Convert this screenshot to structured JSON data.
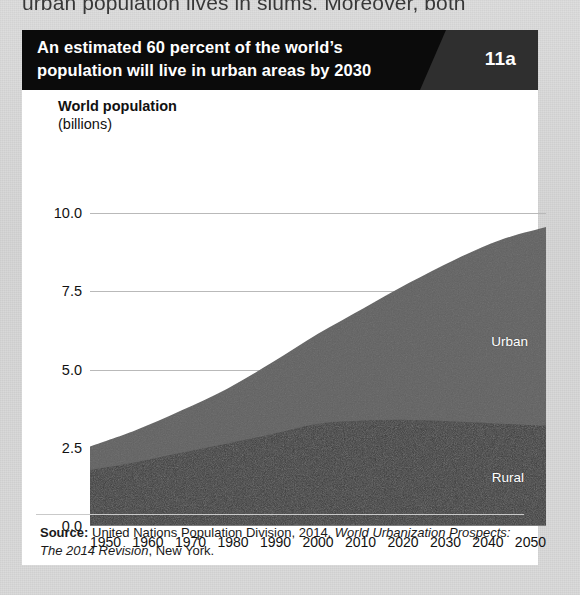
{
  "page": {
    "background_color": "#d8d8d8",
    "body_text_cutoff": "urban population lives in slums. Moreover, both"
  },
  "figure": {
    "header": {
      "title": "An estimated 60 percent of the world’s population will live in urban areas by 2030",
      "number": "11a",
      "background_color": "#0b0b0b",
      "number_panel_color": "#2f2f2f",
      "text_color": "#ffffff"
    },
    "source": {
      "label": "Source:",
      "text_before_italic": " United Nations Population Division, 2014, ",
      "italic_text": "World Urbanization Prospects: The 2014 Revision",
      "text_after_italic": ", New York."
    }
  },
  "chart_data": {
    "type": "area",
    "stacked": true,
    "title": "World population",
    "subtitle": "(billions)",
    "ylabel": "World population (billions)",
    "xlabel": "",
    "ylim": [
      0,
      10
    ],
    "yticks": [
      "0.0",
      "2.5",
      "5.0",
      "7.5",
      "10.0"
    ],
    "ytick_values": [
      0,
      2.5,
      5,
      7.5,
      10
    ],
    "grid": true,
    "legend_position": "inline-labels",
    "x": [
      1950,
      1960,
      1970,
      1980,
      1990,
      2000,
      2010,
      2020,
      2030,
      2040,
      2050
    ],
    "categories": [
      "1950",
      "1960",
      "1970",
      "1980",
      "1990",
      "2000",
      "2010",
      "2020",
      "2030",
      "2040",
      "2050"
    ],
    "series": [
      {
        "name": "Rural",
        "color": "#3a3a3a",
        "label_color": "#ffffff",
        "values": [
          1.79,
          2.04,
          2.34,
          2.63,
          2.94,
          3.27,
          3.37,
          3.39,
          3.34,
          3.27,
          3.21
        ]
      },
      {
        "name": "Urban",
        "color": "#616161",
        "label_color": "#ffffff",
        "values": [
          0.75,
          1.02,
          1.35,
          1.75,
          2.29,
          2.87,
          3.59,
          4.38,
          5.17,
          5.87,
          6.34
        ]
      }
    ],
    "totals": [
      2.54,
      3.06,
      3.69,
      4.38,
      5.23,
      6.14,
      6.96,
      7.77,
      8.51,
      9.14,
      9.55
    ]
  }
}
